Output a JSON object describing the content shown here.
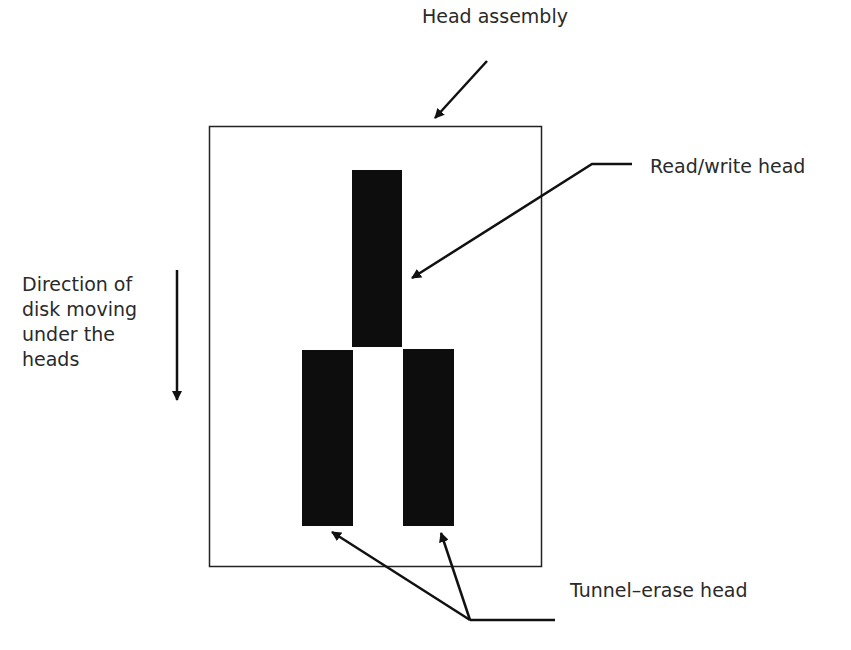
{
  "diagram": {
    "labels": {
      "head_assembly": "Head assembly",
      "read_write_head": "Read/write head",
      "direction_line1": "Direction of",
      "direction_line2": "disk moving",
      "direction_line3": "under the",
      "direction_line4": "heads",
      "tunnel_erase_head": "Tunnel–erase head"
    },
    "components": [
      {
        "name": "head-assembly",
        "shape": "rectangle-outline"
      },
      {
        "name": "read-write-head",
        "shape": "filled-rectangle",
        "position": "top-center"
      },
      {
        "name": "tunnel-erase-head-left",
        "shape": "filled-rectangle",
        "position": "bottom-left"
      },
      {
        "name": "tunnel-erase-head-right",
        "shape": "filled-rectangle",
        "position": "bottom-right"
      }
    ],
    "arrows": [
      {
        "from": "Head assembly",
        "to": "head-assembly"
      },
      {
        "from": "Read/write head",
        "to": "read-write-head"
      },
      {
        "from": "Tunnel–erase head",
        "to": "tunnel-erase-head-left"
      },
      {
        "from": "Tunnel–erase head",
        "to": "tunnel-erase-head-right"
      },
      {
        "name": "direction-arrow",
        "direction": "down"
      }
    ],
    "colors": {
      "stroke": "#1a1a1a",
      "fill": "#0d0d0d",
      "background": "#ffffff"
    }
  }
}
